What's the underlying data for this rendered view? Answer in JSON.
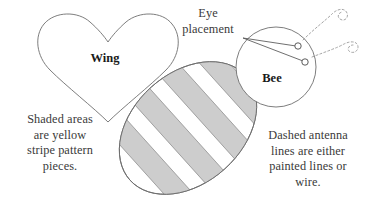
{
  "figure": {
    "type": "sewing-pattern-diagram",
    "subject": "Bee",
    "background_color": "#ffffff",
    "line_color": "#6e6e6e",
    "shade_color": "#cdcdcd",
    "text_color": "#3a3a3a"
  },
  "labels": {
    "wing": "Wing",
    "bee": "Bee"
  },
  "callouts": {
    "eye_placement": "Eye\nplacement",
    "shaded_areas": "Shaded areas\nare yellow\nstripe pattern\npieces.",
    "dashed_antenna": "Dashed antenna\nlines are either\npainted lines or\nwire."
  },
  "parts": {
    "wing_shape": "heart",
    "head_shape": "circle",
    "body_shape": "ellipse",
    "stripe_count": 4,
    "eye_count": 2,
    "antenna_count": 2,
    "antenna_style": "dashed"
  }
}
